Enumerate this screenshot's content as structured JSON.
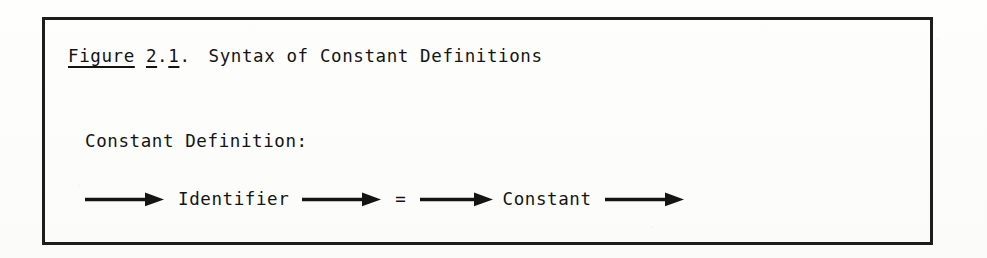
{
  "document": {
    "kind": "scanned-book-figure",
    "ink_color": "#141414",
    "paper_color": "#fdfdfc",
    "border_color": "#1d1d1d"
  },
  "figure": {
    "caption": {
      "label_word": "Figure",
      "number": "2",
      "dot_1": ".",
      "subnumber": "1",
      "dot_2": ".",
      "title": "Syntax of Constant Definitions",
      "full_text": "Figure 2.1.  Syntax of Constant Definitions"
    },
    "production": {
      "name": "Constant Definition:"
    },
    "railroad": {
      "nodes": [
        {
          "type": "arrow",
          "name": "entry-arrow",
          "glyph": "long-arrow-right"
        },
        {
          "type": "terminal",
          "name": "identifier",
          "label": "Identifier"
        },
        {
          "type": "arrow",
          "name": "arrow-after-identifier",
          "glyph": "long-arrow-right"
        },
        {
          "type": "terminal",
          "name": "equals-sign",
          "label": "="
        },
        {
          "type": "arrow",
          "name": "arrow-after-equals",
          "glyph": "long-arrow-right"
        },
        {
          "type": "terminal",
          "name": "constant",
          "label": "Constant"
        },
        {
          "type": "arrow",
          "name": "exit-arrow",
          "glyph": "long-arrow-right"
        }
      ]
    }
  }
}
